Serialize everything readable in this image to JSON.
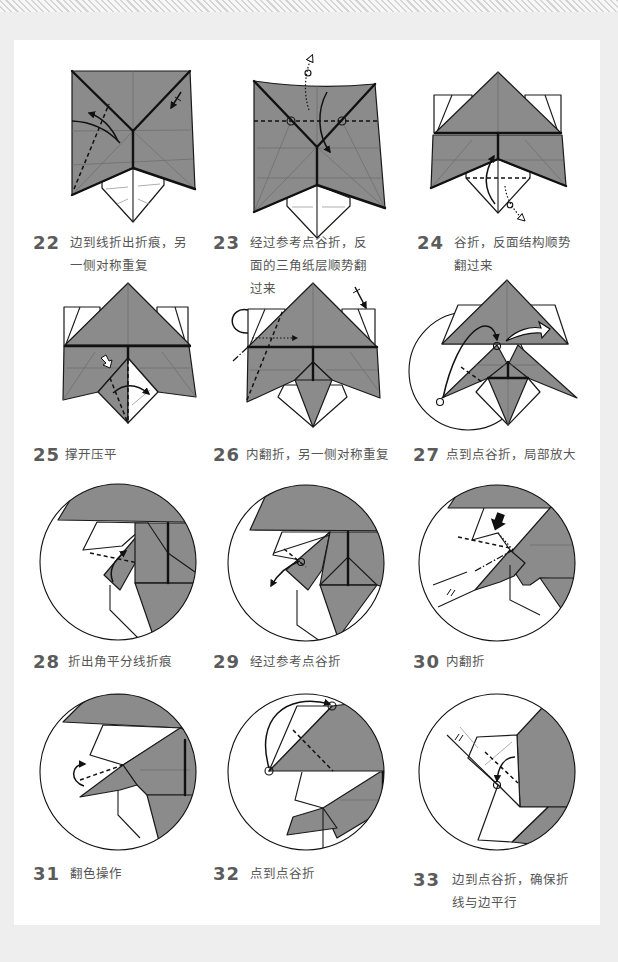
{
  "page": {
    "background": "#eeeeee",
    "panel_background": "#ffffff",
    "paper_color": "#8b8b8b",
    "line_color": "#111111"
  },
  "steps": [
    {
      "number": "22",
      "text": "边到线折出折痕，另一侧对称重复"
    },
    {
      "number": "23",
      "text": "经过参考点谷折，反面的三角纸层顺势翻过来"
    },
    {
      "number": "24",
      "text": "谷折，反面结构顺势翻过来"
    },
    {
      "number": "25",
      "text": "撑开压平"
    },
    {
      "number": "26",
      "text": "内翻折，另一侧对称重复"
    },
    {
      "number": "27",
      "text": "点到点谷折，局部放大"
    },
    {
      "number": "28",
      "text": "折出角平分线折痕"
    },
    {
      "number": "29",
      "text": "经过参考点谷折"
    },
    {
      "number": "30",
      "text": "内翻折"
    },
    {
      "number": "31",
      "text": "翻色操作"
    },
    {
      "number": "32",
      "text": "点到点谷折"
    },
    {
      "number": "33",
      "text": "边到点谷折，确保折线与边平行"
    }
  ]
}
